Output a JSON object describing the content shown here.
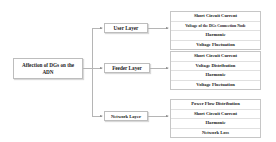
{
  "diagram": {
    "root": {
      "label": "Affection of DGs on the ADN"
    },
    "layers": [
      {
        "label": "User Layer",
        "items": [
          "Short Circuit Current",
          "Voltage of the DGs Connection Node",
          "Harmonic",
          "Voltage Fluctuation"
        ]
      },
      {
        "label": "Feeder Layer",
        "items": [
          "Short Circuit Current",
          "Voltage Distribution",
          "Harmonic",
          "Voltage Fluctuation"
        ]
      },
      {
        "label": "Network Layer",
        "items": [
          "Power Flow Distribution",
          "Short Circuit Current",
          "Harmonic",
          "Network Loss"
        ]
      }
    ]
  }
}
